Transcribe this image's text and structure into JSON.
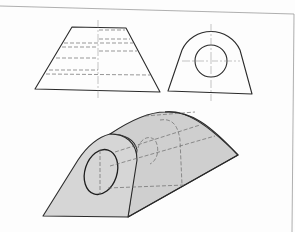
{
  "figure": {
    "type": "orthographic-and-isometric-technical-drawing",
    "views": [
      {
        "id": "front-view",
        "shape": "trapezoid",
        "hidden_lines": 6,
        "centerline": "vertical"
      },
      {
        "id": "side-view",
        "shape": "arched-block-with-circular-hole",
        "centerlines": [
          "vertical",
          "horizontal"
        ]
      },
      {
        "id": "isometric-view",
        "shape": "tapered-arched-block-with-through-hole",
        "fill_color": "#d6d6d6"
      }
    ],
    "colors": {
      "line": "#2a2a2a",
      "hidden_line": "#6a6a6a",
      "frame": "#9a9a9a",
      "solid_fill": "#d6d6d6"
    }
  }
}
